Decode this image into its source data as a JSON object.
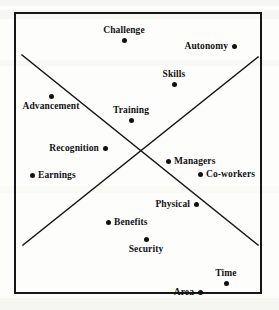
{
  "figure": {
    "title": "",
    "background_color": "#fdfdfb",
    "frame_color": "#16161a",
    "point_color": "#111114",
    "label_color": "#121216"
  },
  "chart_data": {
    "type": "scatter",
    "title": "",
    "subtitle": "",
    "xlabel": "",
    "ylabel": "",
    "xlim": [
      0,
      279
    ],
    "ylim": [
      0,
      310
    ],
    "grid": false,
    "legend": "none",
    "axis_ticks": [],
    "annotations": [
      {
        "name": "diagonal-descending",
        "type": "line",
        "x1": 22,
        "y1": 55,
        "x2": 258,
        "y2": 245
      },
      {
        "name": "diagonal-ascending",
        "type": "line",
        "x1": 23,
        "y1": 245,
        "x2": 258,
        "y2": 57
      }
    ],
    "points": [
      {
        "label": "Challenge",
        "x": 124,
        "y": 40,
        "label_pos": "above"
      },
      {
        "label": "Autonomy",
        "x": 234,
        "y": 46,
        "label_pos": "left"
      },
      {
        "label": "Skills",
        "x": 174,
        "y": 84,
        "label_pos": "above"
      },
      {
        "label": "Advancement",
        "x": 51,
        "y": 96,
        "label_pos": "below"
      },
      {
        "label": "Training",
        "x": 131,
        "y": 120,
        "label_pos": "above"
      },
      {
        "label": "Recognition",
        "x": 105,
        "y": 148,
        "label_pos": "left"
      },
      {
        "label": "Earnings",
        "x": 32,
        "y": 175,
        "label_pos": "right"
      },
      {
        "label": "Managers",
        "x": 168,
        "y": 161,
        "label_pos": "right"
      },
      {
        "label": "Co-workers",
        "x": 200,
        "y": 174,
        "label_pos": "right"
      },
      {
        "label": "Physical",
        "x": 196,
        "y": 204,
        "label_pos": "left"
      },
      {
        "label": "Benefits",
        "x": 108,
        "y": 222,
        "label_pos": "right"
      },
      {
        "label": "Security",
        "x": 146,
        "y": 239,
        "label_pos": "below"
      },
      {
        "label": "Time",
        "x": 226,
        "y": 283,
        "label_pos": "above"
      },
      {
        "label": "Area",
        "x": 200,
        "y": 292,
        "label_pos": "left"
      }
    ]
  }
}
